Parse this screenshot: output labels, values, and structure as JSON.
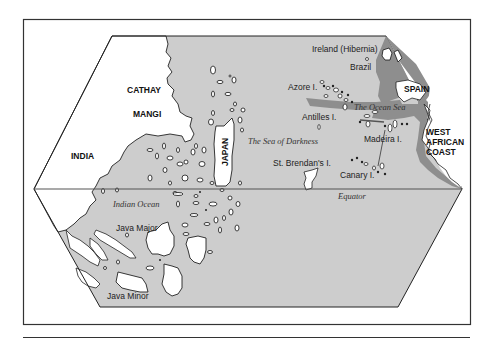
{
  "figure": {
    "type": "historical-map",
    "colors": {
      "ocean": "#cdcdcd",
      "ocean_sea_band": "#8e8e8e",
      "land": "#ffffff",
      "outline": "#222222",
      "frame": "#333333"
    }
  },
  "labels": {
    "cathay": "CATHAY",
    "mangi": "MANGI",
    "india": "INDIA",
    "japan": "JAPAN",
    "ireland": "Ireland (Hibernia)",
    "brazil": "Brazil",
    "azore": "Azore I.",
    "spain": "SPAIN",
    "ocean_sea": "The Ocean Sea",
    "antilles": "Antilles I.",
    "sea_of_darkness": "The Sea of Darkness",
    "madeira": "Madeira I.",
    "west_african_coast_line1": "WEST",
    "west_african_coast_line2": "AFRICAN",
    "west_african_coast_line3": "COAST",
    "st_brendans": "St. Brendan's I.",
    "canary": "Canary I.",
    "equator": "Equator",
    "indian_ocean": "Indian Ocean",
    "java_major": "Java Major",
    "java_minor": "Java Minor"
  }
}
